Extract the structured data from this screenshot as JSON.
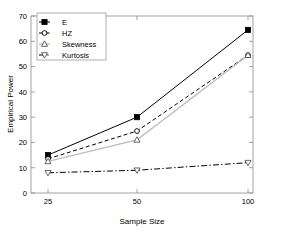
{
  "chart_data": {
    "type": "line",
    "title": "",
    "xlabel": "Sample Size",
    "ylabel": "Empirical Power",
    "categories": [
      "25",
      "50",
      "100"
    ],
    "x": [
      25,
      50,
      100
    ],
    "xtick_labels": [
      "25",
      "50",
      "100"
    ],
    "ytick_labels": [
      "0",
      "10",
      "20",
      "30",
      "40",
      "50",
      "60",
      "70"
    ],
    "yticks": [
      0,
      10,
      20,
      30,
      40,
      50,
      60,
      70
    ],
    "ylim": [
      0,
      70
    ],
    "grid": false,
    "legend_position": "upper-left",
    "series": [
      {
        "name": "E",
        "values": [
          15,
          30,
          64.5
        ],
        "marker": "filled-square",
        "linestyle": "solid",
        "color": "#000000"
      },
      {
        "name": "HZ",
        "values": [
          13.5,
          24.5,
          54.5
        ],
        "marker": "circle",
        "linestyle": "dashed",
        "color": "#000000"
      },
      {
        "name": "Skewness",
        "values": [
          12.5,
          21,
          54.5
        ],
        "marker": "triangle-up",
        "linestyle": "solid-light",
        "color": "#bdbdbd"
      },
      {
        "name": "Kurtosis",
        "values": [
          8,
          9,
          12
        ],
        "marker": "triangle-down",
        "linestyle": "dash-dot",
        "color": "#000000"
      }
    ]
  },
  "legend": {
    "entries": [
      {
        "label": "E"
      },
      {
        "label": "HZ"
      },
      {
        "label": "Skewness"
      },
      {
        "label": "Kurtosis"
      }
    ]
  },
  "colors": {
    "axis": "#4d4d4d",
    "frame": "#808080",
    "series_primary": "#000000",
    "series_light": "#bdbdbd",
    "background": "#ffffff"
  }
}
